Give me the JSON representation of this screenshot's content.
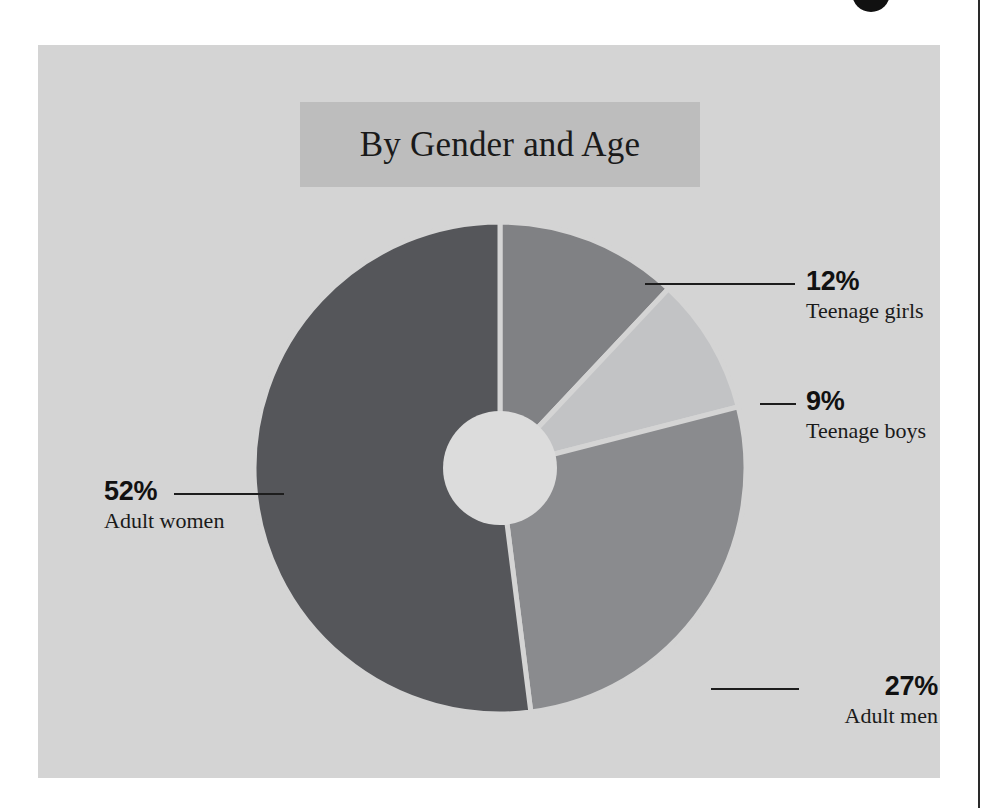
{
  "chart_data": {
    "type": "pie",
    "variant": "donut",
    "title": "By Gender and Age",
    "xlabel": "",
    "ylabel": "",
    "legend_position": "callout-labels",
    "grid": false,
    "unit": "%",
    "total": 100,
    "categories": [
      "Adult women",
      "Adult men",
      "Teenage girls",
      "Teenage boys"
    ],
    "values": [
      52,
      27,
      12,
      9
    ],
    "labels": [
      "52%",
      "27%",
      "12%",
      "9%"
    ],
    "slices": [
      {
        "label": "Teenage girls",
        "value": 12,
        "value_label": "12%",
        "color": "#808184",
        "start_deg": 0,
        "end_deg": 43.2
      },
      {
        "label": "Teenage boys",
        "value": 9,
        "value_label": "9%",
        "color": "#c2c3c5",
        "start_deg": 43.2,
        "end_deg": 75.6
      },
      {
        "label": "Adult men",
        "value": 27,
        "value_label": "27%",
        "color": "#8a8b8e",
        "start_deg": 75.6,
        "end_deg": 172.8
      },
      {
        "label": "Adult women",
        "value": 52,
        "value_label": "52%",
        "color": "#55565a",
        "start_deg": 172.8,
        "end_deg": 360
      }
    ]
  },
  "title": {
    "text": "By Gender and Age"
  },
  "callouts": {
    "teenage_girls": {
      "pct": "12%",
      "category": "Teenage girls"
    },
    "teenage_boys": {
      "pct": "9%",
      "category": "Teenage boys"
    },
    "adult_men": {
      "pct": "27%",
      "category": "Adult men"
    },
    "adult_women": {
      "pct": "52%",
      "category": "Adult women"
    }
  },
  "colors": {
    "canvas": "#d4d4d4",
    "banner": "#bdbdbd",
    "page": "#ffffff",
    "rule": "#2a2a2a",
    "hole": "#dcdcdc",
    "slice_gap": "#d4d4d4",
    "adult_women": "#55565a",
    "adult_men": "#8a8b8e",
    "teenage_girls": "#808184",
    "teenage_boys": "#c2c3c5",
    "text": "#111111"
  }
}
